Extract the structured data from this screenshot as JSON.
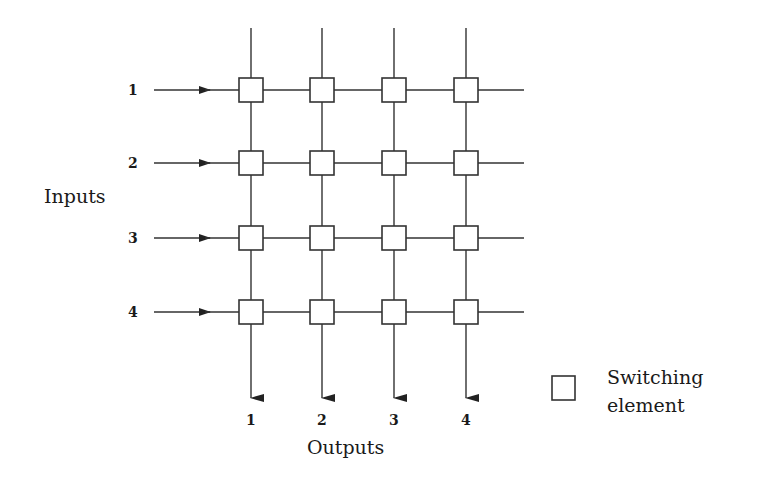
{
  "diagram": {
    "type": "crossbar-switch",
    "rows": 4,
    "columns": 4,
    "colors": {
      "line": "#333333",
      "box_fill": "#ffffff",
      "text": "#1a1a1a"
    },
    "inputs": {
      "title": "Inputs",
      "labels": [
        "1",
        "2",
        "3",
        "4"
      ]
    },
    "outputs": {
      "title": "Outputs",
      "labels": [
        "1",
        "2",
        "3",
        "4"
      ]
    },
    "legend": {
      "symbol": "square-box",
      "line1": "Switching",
      "line2": "element"
    }
  }
}
